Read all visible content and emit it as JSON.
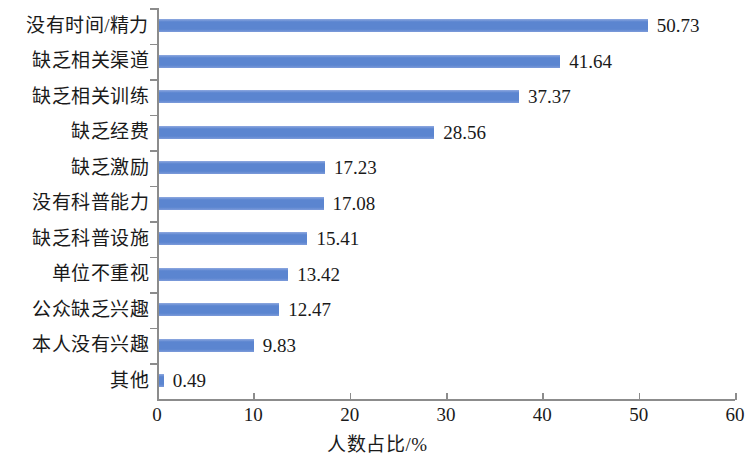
{
  "chart_data": {
    "type": "bar",
    "orientation": "horizontal",
    "title": "",
    "subtitle": "",
    "xlabel": "人数占比/%",
    "ylabel": "",
    "xlim": [
      0,
      60
    ],
    "xticks": [
      "0",
      "10",
      "20",
      "30",
      "40",
      "50",
      "60"
    ],
    "xtick_values": [
      0,
      10,
      20,
      30,
      40,
      50,
      60
    ],
    "grid": false,
    "legend": null,
    "bar_color": "#5B85D0",
    "axis_color": "#8c8c8c",
    "background": "#ffffff",
    "categories": [
      "没有时间/精力",
      "缺乏相关渠道",
      "缺乏相关训练",
      "缺乏经费",
      "缺乏激励",
      "没有科普能力",
      "缺乏科普设施",
      "单位不重视",
      "公众缺乏兴趣",
      "本人没有兴趣",
      "其他"
    ],
    "values": [
      50.73,
      41.64,
      37.37,
      28.56,
      17.23,
      17.08,
      15.41,
      13.42,
      12.47,
      9.83,
      0.49
    ],
    "value_labels": [
      "50.73",
      "41.64",
      "37.37",
      "28.56",
      "17.23",
      "17.08",
      "15.41",
      "13.42",
      "12.47",
      "9.83",
      "0.49"
    ]
  }
}
